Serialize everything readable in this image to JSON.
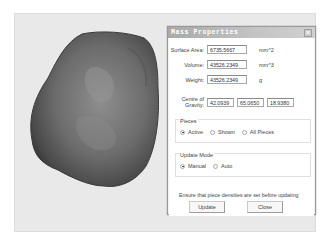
{
  "viewport": {
    "object": "3D rock mesh"
  },
  "dialog": {
    "title": "Mass Properties",
    "close_label": "×",
    "fields": {
      "surface_area": {
        "label": "Surface Area:",
        "value": "6735.5667",
        "unit": "mm^2"
      },
      "volume": {
        "label": "Volume:",
        "value": "43526.2349",
        "unit": "mm^3"
      },
      "weight": {
        "label": "Weight:",
        "value": "43526.2349",
        "unit": "g"
      },
      "centre_of_gravity": {
        "label": "Centre of Gravity:",
        "x": "42.0939",
        "y": "65.0650",
        "z": "18.9380"
      }
    },
    "pieces": {
      "title": "Pieces",
      "options": [
        "Active",
        "Shown",
        "All Pieces"
      ],
      "selected": "Active"
    },
    "update_mode": {
      "title": "Update Mode",
      "options": [
        "Manual",
        "Auto"
      ],
      "selected": "Manual"
    },
    "note": "Ensure that piece densities are set before updating",
    "buttons": {
      "update": "Update",
      "close": "Close"
    }
  }
}
